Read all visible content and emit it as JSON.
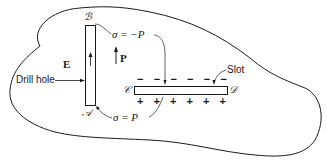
{
  "figure": {
    "type": "physics-diagram",
    "colors": {
      "stroke": "#1a1a1a",
      "background": "#ffffff"
    }
  },
  "labels": {
    "field_E": "E",
    "polarization_P": "P",
    "drill_hole": "Drill hole",
    "slot": "Slot",
    "sigma_top": "σ = −P",
    "sigma_bottom": "σ = P",
    "point_A": "𝒜",
    "point_B": "ℬ",
    "point_C": "𝒞",
    "point_D": "𝒟"
  },
  "charges": {
    "top_row": [
      "−",
      "−",
      "−",
      "−",
      "−",
      "−"
    ],
    "bottom_row": [
      "+",
      "+",
      "+",
      "+",
      "+",
      "+"
    ]
  }
}
